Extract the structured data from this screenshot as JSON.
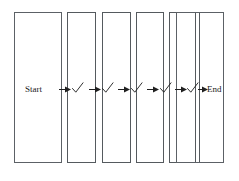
{
  "diagram": {
    "background_color": "#ffffff",
    "stroke_color": "#555a5e",
    "text_color": "#1a1a1a",
    "start_label": "Start",
    "end_label": "End",
    "check_glyph": "check-mark",
    "arrow_glyph": "right-arrow",
    "lanes": [
      {
        "name": "lane-1-start",
        "x": 14,
        "y": 12,
        "w": 48,
        "h": 151,
        "content": "Start"
      },
      {
        "name": "lane-2",
        "x": 67,
        "y": 12,
        "w": 29,
        "h": 151,
        "content": "check"
      },
      {
        "name": "lane-3",
        "x": 102,
        "y": 12,
        "w": 29,
        "h": 151,
        "content": "check"
      },
      {
        "name": "lane-4",
        "x": 136,
        "y": 12,
        "w": 27,
        "h": 151,
        "content": "check"
      },
      {
        "name": "lane-5",
        "x": 168,
        "y": 12,
        "w": 26,
        "h": 151,
        "content": "check"
      },
      {
        "name": "lane-6",
        "x": 175,
        "y": 12,
        "w": 26,
        "h": 151,
        "content": "check"
      },
      {
        "name": "lane-7-end",
        "x": 176,
        "y": 12,
        "w": 48,
        "h": 151,
        "content": "End"
      }
    ],
    "checks": [
      {
        "name": "check-1",
        "x": 73,
        "y": 85
      },
      {
        "name": "check-2",
        "x": 104,
        "y": 85
      },
      {
        "name": "check-3",
        "x": 133,
        "y": 85
      },
      {
        "name": "check-4",
        "x": 161,
        "y": 85
      },
      {
        "name": "check-5",
        "x": 188,
        "y": 85
      }
    ],
    "arrows": [
      {
        "name": "arrow-1",
        "x": 59,
        "y": 88,
        "len": 12
      },
      {
        "name": "arrow-2",
        "x": 88,
        "y": 88,
        "len": 12
      },
      {
        "name": "arrow-3",
        "x": 118,
        "y": 88,
        "len": 12
      },
      {
        "name": "arrow-4",
        "x": 147,
        "y": 88,
        "len": 12
      },
      {
        "name": "arrow-5",
        "x": 174,
        "y": 88,
        "len": 12
      },
      {
        "name": "arrow-6",
        "x": 200,
        "y": 88,
        "len": 9
      }
    ]
  }
}
